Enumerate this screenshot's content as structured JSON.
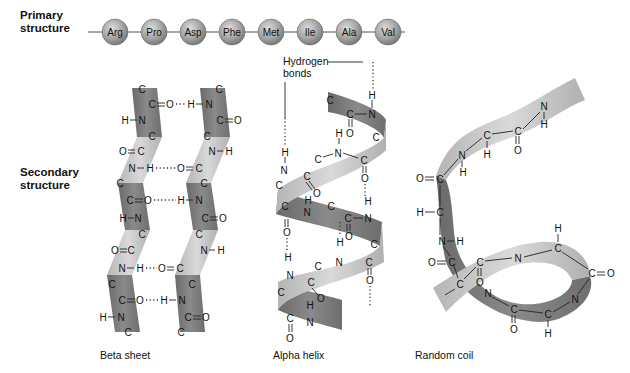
{
  "labels": {
    "primary": "Primary structure",
    "primary_line1": "Primary",
    "primary_line2": "structure",
    "secondary_line1": "Secondary",
    "secondary_line2": "structure"
  },
  "primary_chain": {
    "residues": [
      "Arg",
      "Pro",
      "Asp",
      "Phe",
      "Met",
      "Ile",
      "Ala",
      "Val"
    ]
  },
  "panels": {
    "beta_sheet": {
      "caption": "Beta sheet"
    },
    "alpha_helix": {
      "caption": "Alpha helix",
      "annotation_line1": "Hydrogen",
      "annotation_line2": "bonds"
    },
    "random_coil": {
      "caption": "Random coil"
    }
  },
  "colors": {
    "ribbon_dark": "#7d7d7d",
    "ribbon_light": "#c4c4c4",
    "bead": "#a9a9a9",
    "text": "#111111"
  }
}
